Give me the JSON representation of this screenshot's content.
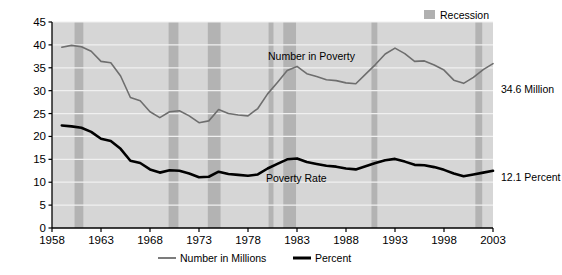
{
  "chart_data": {
    "type": "line",
    "title": "",
    "xlabel": "",
    "ylabel": "",
    "xlim": [
      1958,
      2003
    ],
    "ylim": [
      0,
      45
    ],
    "grid": true,
    "legend_position": "bottom-center",
    "x_ticks": [
      "1958",
      "1963",
      "1968",
      "1973",
      "1978",
      "1983",
      "1988",
      "1993",
      "1998",
      "2003"
    ],
    "y_ticks": [
      "0",
      "5",
      "10",
      "15",
      "20",
      "25",
      "30",
      "35",
      "40",
      "45"
    ],
    "x": [
      1959,
      1960,
      1961,
      1962,
      1963,
      1964,
      1965,
      1966,
      1967,
      1968,
      1969,
      1970,
      1971,
      1972,
      1973,
      1974,
      1975,
      1976,
      1977,
      1978,
      1979,
      1980,
      1981,
      1982,
      1983,
      1984,
      1985,
      1986,
      1987,
      1988,
      1989,
      1990,
      1991,
      1992,
      1993,
      1994,
      1995,
      1996,
      1997,
      1998,
      1999,
      2000,
      2001,
      2002,
      2003
    ],
    "series": [
      {
        "name": "Number in Millions",
        "color": "#6e6e6e",
        "width": 1.6,
        "values": [
          39.5,
          39.9,
          39.6,
          38.6,
          36.4,
          36.1,
          33.2,
          28.5,
          27.8,
          25.4,
          24.1,
          25.4,
          25.6,
          24.5,
          23.0,
          23.4,
          25.9,
          25.0,
          24.7,
          24.5,
          26.1,
          29.3,
          31.8,
          34.4,
          35.3,
          33.7,
          33.1,
          32.4,
          32.2,
          31.7,
          31.5,
          33.6,
          35.7,
          38.0,
          39.3,
          38.1,
          36.4,
          36.5,
          35.6,
          34.5,
          32.3,
          31.6,
          32.9,
          34.6,
          35.9
        ]
      },
      {
        "name": "Percent",
        "color": "#000000",
        "width": 2.6,
        "values": [
          22.4,
          22.2,
          21.9,
          21.0,
          19.5,
          19.0,
          17.3,
          14.7,
          14.2,
          12.8,
          12.1,
          12.6,
          12.5,
          11.9,
          11.1,
          11.2,
          12.3,
          11.8,
          11.6,
          11.4,
          11.7,
          13.0,
          14.0,
          15.0,
          15.2,
          14.4,
          14.0,
          13.6,
          13.4,
          13.0,
          12.8,
          13.5,
          14.2,
          14.8,
          15.1,
          14.5,
          13.8,
          13.7,
          13.3,
          12.7,
          11.9,
          11.3,
          11.7,
          12.1,
          12.5
        ]
      }
    ],
    "recessions": [
      {
        "start": 1960.3,
        "end": 1961.2
      },
      {
        "start": 1969.9,
        "end": 1970.9
      },
      {
        "start": 1973.9,
        "end": 1975.2
      },
      {
        "start": 1980.1,
        "end": 1980.6
      },
      {
        "start": 1981.6,
        "end": 1982.9
      },
      {
        "start": 1990.6,
        "end": 1991.2
      },
      {
        "start": 2001.2,
        "end": 2001.9
      }
    ],
    "annotations": [
      {
        "name": "number-in-poverty",
        "text": "Number in Poverty",
        "x_px": 268,
        "y_px": 60
      },
      {
        "name": "poverty-rate",
        "text": "Poverty Rate",
        "x_px": 266,
        "y_px": 182
      }
    ],
    "end_labels": [
      {
        "name": "million-value",
        "text": "34.6 Million",
        "y_px": 89
      },
      {
        "name": "percent-value",
        "text": "12.1 Percent",
        "y_px": 177
      }
    ],
    "legend": {
      "recession": {
        "label": "Recession",
        "color": "#b0b0b0"
      },
      "entries": [
        {
          "label": "Number in Millions",
          "color": "#6e6e6e",
          "width": 1.8
        },
        {
          "label": "Percent",
          "color": "#000000",
          "width": 3
        }
      ]
    },
    "style": {
      "plot_background": "#d6d6d6",
      "recession_band": "#b3b3b3",
      "gridline": "#f0f0f0",
      "axis": "#000000"
    }
  }
}
